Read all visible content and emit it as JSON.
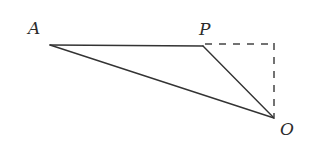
{
  "figure": {
    "type": "geometry-diagram",
    "background_color": "#ffffff",
    "stroke_color": "#333333",
    "dash_color": "#444444",
    "label_color": "#2b2b2b",
    "width": 310,
    "height": 162
  },
  "points": {
    "A": {
      "label": "A",
      "x": 50,
      "y": 45
    },
    "P": {
      "label": "P",
      "x": 203,
      "y": 46
    },
    "O": {
      "label": "O",
      "x": 274,
      "y": 118
    },
    "C": {
      "label": "",
      "x": 274,
      "y": 44
    }
  },
  "segments": [
    {
      "name": "AP",
      "from": "A",
      "to": "P",
      "style": "solid"
    },
    {
      "name": "AO",
      "from": "A",
      "to": "O",
      "style": "solid"
    },
    {
      "name": "PO",
      "from": "P",
      "to": "O",
      "style": "solid"
    },
    {
      "name": "PC",
      "from": "P",
      "to": "C",
      "style": "dashed"
    },
    {
      "name": "CO",
      "from": "C",
      "to": "O",
      "style": "dashed"
    }
  ],
  "labels": {
    "A": "A",
    "P": "P",
    "O": "O"
  }
}
